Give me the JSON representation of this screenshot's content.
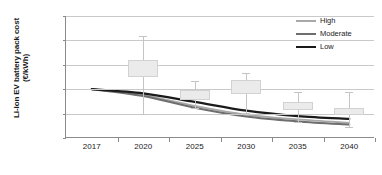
{
  "chart_data": {
    "type": "line",
    "title": "",
    "xlabel": "",
    "ylabel": "Li-Ion EV battery pack cost (€/kWh)",
    "ylabel_line1": "Li-Ion EV battery pack cost",
    "ylabel_line2": "(€/kWh)",
    "categories": [
      "2017",
      "2020",
      "2025",
      "2030",
      "2035",
      "2040"
    ],
    "x_tick_labels": [
      "2017",
      "2020",
      "2025",
      "2030",
      "2035",
      "2040"
    ],
    "y_tick_labels": [
      "0",
      "100",
      "200",
      "300",
      "400",
      "500"
    ],
    "y_tick_values": [
      0,
      100,
      200,
      300,
      400,
      500
    ],
    "ylim": [
      0,
      500
    ],
    "grid": true,
    "legend_position": "top-right",
    "series": [
      {
        "name": "High",
        "color": "#a8a8a8",
        "width": 1.8,
        "values": [
          200,
          176,
          132,
          96,
          76,
          62
        ]
      },
      {
        "name": "Moderate",
        "color": "#6e6e6e",
        "width": 2.0,
        "values": [
          200,
          172,
          124,
          88,
          68,
          55
        ]
      },
      {
        "name": "Low",
        "color": "#1a1a1a",
        "width": 2.2,
        "values": [
          200,
          183,
          148,
          112,
          90,
          78
        ]
      }
    ],
    "boxes": [
      {
        "category": "2020",
        "q1": 250,
        "q3": 320,
        "whisker_low": 100,
        "whisker_high": 420
      },
      {
        "category": "2025",
        "q1": 155,
        "q3": 197,
        "whisker_low": 122,
        "whisker_high": 232
      },
      {
        "category": "2030",
        "q1": 180,
        "q3": 237,
        "whisker_low": 103,
        "whisker_high": 265
      },
      {
        "category": "2035",
        "q1": 115,
        "q3": 147,
        "whisker_low": 64,
        "whisker_high": 190
      },
      {
        "category": "2040",
        "q1": 95,
        "q3": 122,
        "whisker_low": 44,
        "whisker_high": 190
      }
    ]
  },
  "legend": {
    "items": [
      {
        "label": "High",
        "color": "#a8a8a8"
      },
      {
        "label": "Moderate",
        "color": "#6e6e6e"
      },
      {
        "label": "Low",
        "color": "#1a1a1a"
      }
    ]
  },
  "colors": {
    "box_fill": "#ebebeb",
    "box_border": "#d2d2d2",
    "whisker": "#c4c4c4",
    "gridline": "#c9c9c9",
    "axis": "#8a8a8a",
    "text": "#1a1a1a"
  }
}
